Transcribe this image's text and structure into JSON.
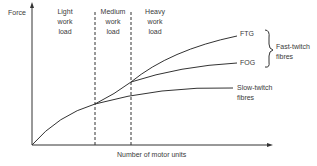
{
  "axes": {
    "y_label": "Force",
    "x_label": "Number of motor units"
  },
  "zones": [
    {
      "label_lines": [
        "Light",
        "work",
        "load"
      ]
    },
    {
      "label_lines": [
        "Medium",
        "work",
        "load"
      ]
    },
    {
      "label_lines": [
        "Heavy",
        "work",
        "load"
      ]
    }
  ],
  "curves": {
    "ftg": "FTG",
    "fog": "FOG",
    "slow_twitch_lines": [
      "Slow-twitch",
      "fibres"
    ]
  },
  "group_label_lines": [
    "Fast-twitch",
    "fibres"
  ],
  "colors": {
    "line": "#333333",
    "text": "#3a3a3a",
    "background": "#ffffff"
  }
}
